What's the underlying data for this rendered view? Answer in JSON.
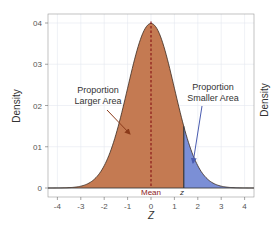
{
  "chart_data": {
    "type": "area",
    "title": "",
    "xlabel": "Z",
    "ylabel": "Density",
    "right_ylabel": "Density",
    "xlim": [
      -4.4,
      4.4
    ],
    "ylim": [
      0,
      0.42
    ],
    "x_ticks": [
      "-4",
      "-3",
      "-2",
      "-1",
      "0",
      "1",
      "2",
      "3",
      "4"
    ],
    "y_ticks": [
      "0",
      "01",
      "02",
      "03",
      "04"
    ],
    "grid": true,
    "series": [
      {
        "name": "Standard normal density",
        "x": [
          -4,
          -3,
          -2,
          -1,
          0,
          1,
          2,
          3,
          4
        ],
        "values": [
          0.0001,
          0.0044,
          0.054,
          0.242,
          0.399,
          0.242,
          0.054,
          0.0044,
          0.0001
        ]
      }
    ],
    "shaded_regions": [
      {
        "name": "Proportion Larger Area",
        "from": -4.4,
        "to": 1.4,
        "color": "#c47a52"
      },
      {
        "name": "Proportion Smaller Area",
        "from": 1.4,
        "to": 4.4,
        "color": "#7b8fd6"
      }
    ],
    "markers": [
      {
        "label": "Mean",
        "x": 0,
        "style": "dashed",
        "color": "#8b1a1a"
      },
      {
        "label": "z",
        "x": 1.4,
        "style": "solid",
        "color": "#333333"
      }
    ],
    "annotations": [
      {
        "text_line1": "Proportion",
        "text_line2": "Larger Area"
      },
      {
        "text_line1": "Proportion",
        "text_line2": "Smaller Area"
      }
    ]
  },
  "colors": {
    "larger_area": "#c47a52",
    "smaller_area": "#7b8fd6",
    "mean_line": "#8b1a1a",
    "grid": "#e4e8f0"
  }
}
